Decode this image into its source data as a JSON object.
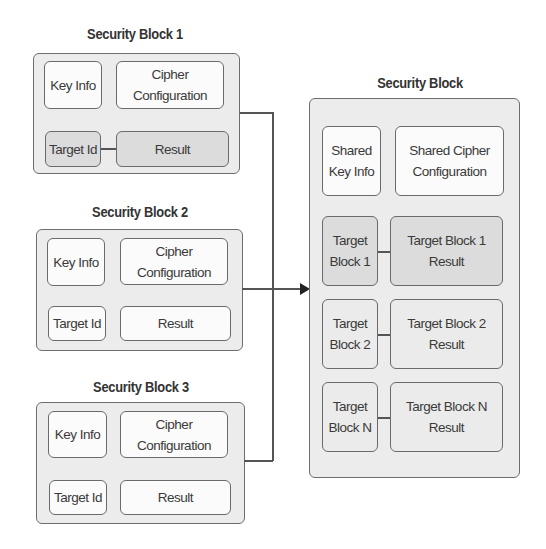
{
  "left_blocks": [
    {
      "title": "Security Block 1",
      "key_info": "Key Info",
      "cipher_line1": "Cipher",
      "cipher_line2": "Configuration",
      "target_id": "Target Id",
      "result": "Result"
    },
    {
      "title": "Security Block 2",
      "key_info": "Key Info",
      "cipher_line1": "Cipher",
      "cipher_line2": "Configuration",
      "target_id": "Target Id",
      "result": "Result"
    },
    {
      "title": "Security Block 3",
      "key_info": "Key Info",
      "cipher_line1": "Cipher",
      "cipher_line2": "Configuration",
      "target_id": "Target Id",
      "result": "Result"
    }
  ],
  "right_block": {
    "title": "Security Block",
    "shared_key_line1": "Shared",
    "shared_key_line2": "Key Info",
    "shared_cipher_line1": "Shared Cipher",
    "shared_cipher_line2": "Configuration",
    "targets": [
      {
        "label_line1": "Target",
        "label_line2": "Block 1",
        "result_line1": "Target Block 1",
        "result_line2": "Result"
      },
      {
        "label_line1": "Target",
        "label_line2": "Block 2",
        "result_line1": "Target Block 2",
        "result_line2": "Result"
      },
      {
        "label_line1": "Target",
        "label_line2": "Block N",
        "result_line1": "Target Block N",
        "result_line2": "Result"
      }
    ]
  },
  "colors": {
    "outer_fill": "#ececec",
    "shaded_fill": "#dcdcdc",
    "box_fill": "#fbfbfb",
    "stroke": "#6a6a6a"
  }
}
